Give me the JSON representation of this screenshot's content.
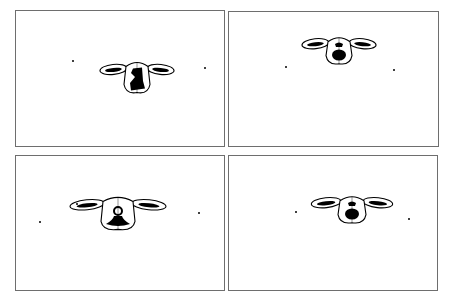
{
  "figure": {
    "layout": "2x2 grid",
    "colors": {
      "frame": "#6e6e6e",
      "ink": "#000000",
      "background": "#ffffff"
    },
    "panels": [
      {
        "id": "top-left",
        "box": [
          15,
          10,
          210,
          137
        ],
        "face": {
          "cx": 136,
          "cy": 78,
          "ear_span": 30,
          "head_w": 22,
          "head_h": 30,
          "patch": "tall-irregular"
        },
        "dots": [
          [
            72,
            60
          ],
          [
            204,
            67
          ]
        ]
      },
      {
        "id": "top-right",
        "box": [
          228,
          11,
          211,
          136
        ],
        "face": {
          "cx": 338,
          "cy": 51,
          "ear_span": 30,
          "head_w": 22,
          "head_h": 26,
          "patch": "muzzle-round"
        },
        "dots": [
          [
            285,
            66
          ],
          [
            393,
            69
          ]
        ]
      },
      {
        "id": "bottom-left",
        "box": [
          15,
          155,
          210,
          136
        ],
        "face": {
          "cx": 117,
          "cy": 214,
          "ear_span": 38,
          "head_w": 30,
          "head_h": 32,
          "patch": "bell-shape"
        },
        "dots": [
          [
            76,
            203
          ],
          [
            39,
            221
          ],
          [
            198,
            212
          ]
        ]
      },
      {
        "id": "bottom-right",
        "box": [
          228,
          155,
          210,
          136
        ],
        "face": {
          "cx": 351,
          "cy": 210,
          "ear_span": 33,
          "head_w": 24,
          "head_h": 26,
          "patch": "muzzle-round"
        },
        "dots": [
          [
            295,
            211
          ],
          [
            408,
            218
          ]
        ]
      }
    ]
  }
}
